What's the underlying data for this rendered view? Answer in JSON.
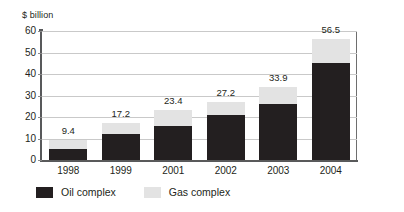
{
  "chart_data": {
    "type": "bar",
    "subtype": "stacked-bar",
    "title": "",
    "xlabel": "",
    "ylabel": "$ billion",
    "ylim": [
      0,
      60
    ],
    "ytick_step": 10,
    "yticks": [
      "60",
      "50",
      "40",
      "30",
      "20",
      "10",
      "0"
    ],
    "grid": true,
    "legend_position": "bottom-left",
    "categories": [
      "1998",
      "1999",
      "2001",
      "2002",
      "2003",
      "2004"
    ],
    "series": [
      {
        "name": "Oil complex",
        "color": "#231f20",
        "values": [
          5.0,
          12.0,
          16.0,
          21.0,
          26.0,
          45.0
        ]
      },
      {
        "name": "Gas complex",
        "color": "#e3e3e3",
        "values": [
          4.4,
          5.2,
          7.4,
          6.2,
          7.9,
          11.5
        ]
      }
    ],
    "totals": [
      9.4,
      17.2,
      23.4,
      27.2,
      33.9,
      56.5
    ],
    "total_labels": [
      "9.4",
      "17.2",
      "23.4",
      "27.2",
      "33.9",
      "56.5"
    ]
  },
  "legend": {
    "items": [
      {
        "label": "Oil complex",
        "swatch": "oil-swatch"
      },
      {
        "label": "Gas complex",
        "swatch": "gas-swatch"
      }
    ]
  },
  "colors": {
    "oil": "#231f20",
    "gas": "#e3e3e3",
    "grid": "#c9c9c9",
    "axis": "#58595b",
    "text": "#231f20",
    "background": "#ffffff"
  }
}
